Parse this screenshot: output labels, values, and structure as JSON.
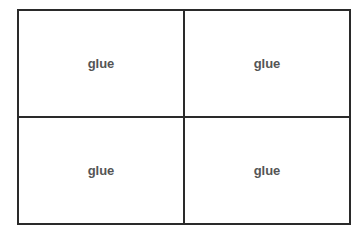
{
  "grid": {
    "cells": [
      {
        "label": "glue"
      },
      {
        "label": "glue"
      },
      {
        "label": "glue"
      },
      {
        "label": "glue"
      }
    ]
  }
}
